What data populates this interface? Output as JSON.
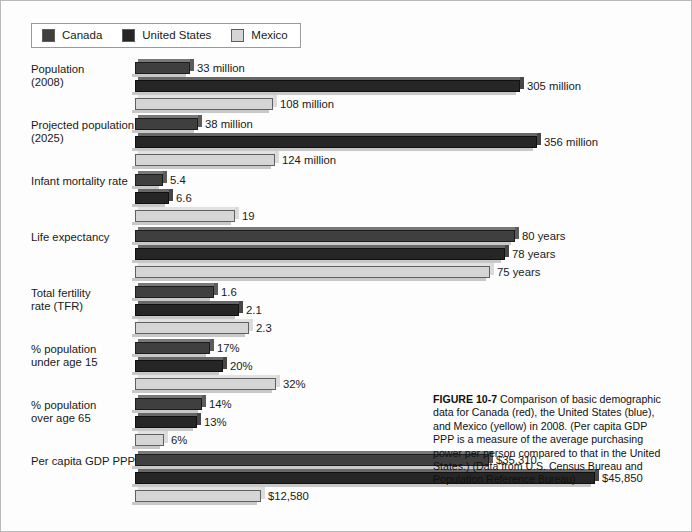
{
  "figure": {
    "legend": {
      "entries": [
        {
          "label": "Canada",
          "color": "#3f3f3f",
          "swatch_name": "legend-swatch-canada"
        },
        {
          "label": "United States",
          "color": "#262626",
          "swatch_name": "legend-swatch-united-states"
        },
        {
          "label": "Mexico",
          "color": "#d5d5d5",
          "swatch_name": "legend-swatch-mexico"
        }
      ]
    },
    "caption": {
      "number": "FIGURE 10-7",
      "text": " Comparison of basic demographic data for Canada (red), the United States (blue), and Mexico (yellow) in 2008. (Per capita GDP PPP is a measure of the average purchasing power per person compared to that in the United States.) (Data from U.S. Census Bureau and Population Reference Bureau)"
    }
  },
  "chart_data": {
    "type": "bar",
    "orientation": "horizontal",
    "xlabel": "",
    "ylabel": "",
    "grid": false,
    "legend_position": "top-left",
    "note": "Each category row is drawn on its own independent horizontal scale; bar lengths are not comparable across rows.",
    "categories": [
      "Population (2008)",
      "Projected population (2025)",
      "Infant mortality rate",
      "Life expectancy",
      "Total fertility rate (TFR)",
      "% population under age 15",
      "% population over age 65",
      "Per capita GDP PPP"
    ],
    "series": [
      {
        "name": "Canada",
        "color": "#3f3f3f",
        "values": [
          33,
          38,
          5.4,
          80,
          1.6,
          17,
          14,
          35310
        ],
        "labels": [
          "33 million",
          "38 million",
          "5.4",
          "80 years",
          "1.6",
          "17%",
          "14%",
          "$35,310"
        ]
      },
      {
        "name": "United States",
        "color": "#262626",
        "values": [
          305,
          356,
          6.6,
          78,
          2.1,
          20,
          13,
          45850
        ],
        "labels": [
          "305 million",
          "356 million",
          "6.6",
          "78 years",
          "2.1",
          "20%",
          "13%",
          "$45,850"
        ]
      },
      {
        "name": "Mexico",
        "color": "#d5d5d5",
        "values": [
          108,
          124,
          19,
          75,
          2.3,
          32,
          6,
          12580
        ],
        "labels": [
          "108 million",
          "124 million",
          "19",
          "75 years",
          "2.3",
          "32%",
          "6%",
          "$12,580"
        ]
      }
    ],
    "rows": [
      {
        "label": "Population\n(2008)",
        "bars": [
          {
            "series": "Canada",
            "label": "33 million",
            "value": 33,
            "width_px": 55,
            "color": "#3f3f3f"
          },
          {
            "series": "United States",
            "label": "305 million",
            "value": 305,
            "width_px": 385,
            "color": "#262626"
          },
          {
            "series": "Mexico",
            "label": "108 million",
            "value": 108,
            "width_px": 138,
            "color": "#d5d5d5"
          }
        ]
      },
      {
        "label": "Projected population\n(2025)",
        "bars": [
          {
            "series": "Canada",
            "label": "38 million",
            "value": 38,
            "width_px": 63,
            "color": "#3f3f3f"
          },
          {
            "series": "United States",
            "label": "356 million",
            "value": 356,
            "width_px": 402,
            "color": "#262626"
          },
          {
            "series": "Mexico",
            "label": "124 million",
            "value": 124,
            "width_px": 140,
            "color": "#d5d5d5"
          }
        ]
      },
      {
        "label": "Infant mortality rate",
        "bars": [
          {
            "series": "Canada",
            "label": "5.4",
            "value": 5.4,
            "width_px": 28,
            "color": "#3f3f3f"
          },
          {
            "series": "United States",
            "label": "6.6",
            "value": 6.6,
            "width_px": 34,
            "color": "#262626"
          },
          {
            "series": "Mexico",
            "label": "19",
            "value": 19,
            "width_px": 100,
            "color": "#d5d5d5"
          }
        ]
      },
      {
        "label": "Life expectancy",
        "bars": [
          {
            "series": "Canada",
            "label": "80 years",
            "value": 80,
            "width_px": 380,
            "color": "#3f3f3f"
          },
          {
            "series": "United States",
            "label": "78 years",
            "value": 78,
            "width_px": 370,
            "color": "#262626"
          },
          {
            "series": "Mexico",
            "label": "75 years",
            "value": 75,
            "width_px": 355,
            "color": "#d5d5d5"
          }
        ]
      },
      {
        "label": "Total fertility\nrate (TFR)",
        "bars": [
          {
            "series": "Canada",
            "label": "1.6",
            "value": 1.6,
            "width_px": 79,
            "color": "#3f3f3f"
          },
          {
            "series": "United States",
            "label": "2.1",
            "value": 2.1,
            "width_px": 104,
            "color": "#262626"
          },
          {
            "series": "Mexico",
            "label": "2.3",
            "value": 2.3,
            "width_px": 114,
            "color": "#d5d5d5"
          }
        ]
      },
      {
        "label": "% population\nunder age 15",
        "bars": [
          {
            "series": "Canada",
            "label": "17%",
            "value": 17,
            "width_px": 75,
            "color": "#3f3f3f"
          },
          {
            "series": "United States",
            "label": "20%",
            "value": 20,
            "width_px": 88,
            "color": "#262626"
          },
          {
            "series": "Mexico",
            "label": "32%",
            "value": 32,
            "width_px": 141,
            "color": "#d5d5d5"
          }
        ]
      },
      {
        "label": "% population\nover age 65",
        "bars": [
          {
            "series": "Canada",
            "label": "14%",
            "value": 14,
            "width_px": 67,
            "color": "#3f3f3f"
          },
          {
            "series": "United States",
            "label": "13%",
            "value": 13,
            "width_px": 62,
            "color": "#262626"
          },
          {
            "series": "Mexico",
            "label": "6%",
            "value": 6,
            "width_px": 29,
            "color": "#d5d5d5"
          }
        ]
      },
      {
        "label": "Per capita GDP PPP",
        "bars": [
          {
            "series": "Canada",
            "label": "$35,310",
            "value": 35310,
            "width_px": 354,
            "color": "#3f3f3f"
          },
          {
            "series": "United States",
            "label": "$45,850",
            "value": 45850,
            "width_px": 460,
            "color": "#262626"
          },
          {
            "series": "Mexico",
            "label": "$12,580",
            "value": 12580,
            "width_px": 126,
            "color": "#d5d5d5"
          }
        ]
      }
    ]
  }
}
